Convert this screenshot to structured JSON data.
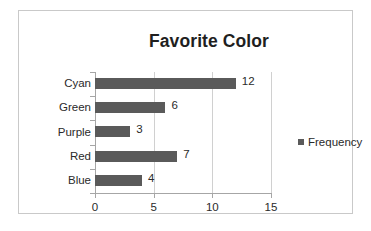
{
  "chart_data": {
    "type": "bar",
    "orientation": "horizontal",
    "title": "Favorite Color",
    "categories": [
      "Cyan",
      "Green",
      "Purple",
      "Red",
      "Blue"
    ],
    "values": [
      12,
      6,
      3,
      7,
      4
    ],
    "data_labels": [
      "12",
      "6",
      "3",
      "7",
      "4"
    ],
    "series": [
      {
        "name": "Frequency",
        "values": [
          12,
          6,
          3,
          7,
          4
        ],
        "color": "#5a5a5a"
      }
    ],
    "xlabel": "",
    "ylabel": "",
    "xlim": [
      0,
      15
    ],
    "xticks": [
      0,
      5,
      10,
      15
    ],
    "xtick_labels": [
      "0",
      "5",
      "10",
      "15"
    ],
    "grid": {
      "vertical": true,
      "horizontal": false
    },
    "legend": {
      "position": "right",
      "entries": [
        "Frequency"
      ]
    }
  },
  "legend": {
    "label": "Frequency",
    "marker": "square-marker"
  },
  "colors": {
    "bar": "#5a5a5a",
    "gridline": "#d0d0d0",
    "axis": "#a6a6a6",
    "frame": "#c9c9c9",
    "text": "#2a2a2a",
    "title": "#1f1f1f",
    "background": "#ffffff"
  }
}
